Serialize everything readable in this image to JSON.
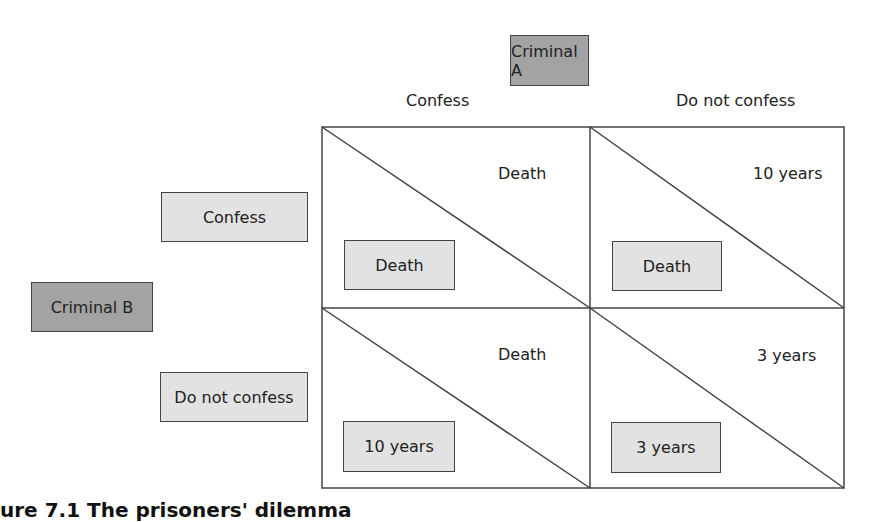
{
  "players": {
    "row_player": "Criminal B",
    "column_player": "Criminal A"
  },
  "column_strategies": [
    "Confess",
    "Do not confess"
  ],
  "row_strategies": [
    "Confess",
    "Do not confess"
  ],
  "cells": [
    {
      "row": "Confess",
      "col": "Confess",
      "payoff_A": "Death",
      "payoff_B": "Death"
    },
    {
      "row": "Confess",
      "col": "Do not confess",
      "payoff_A": "10 years",
      "payoff_B": "Death"
    },
    {
      "row": "Do not confess",
      "col": "Confess",
      "payoff_A": "Death",
      "payoff_B": "10 years"
    },
    {
      "row": "Do not confess",
      "col": "Do not confess",
      "payoff_A": "3 years",
      "payoff_B": "3 years"
    }
  ],
  "colors": {
    "player_box": "#a3a3a3",
    "strategy_box": "#e2e2e2",
    "lines": "#444444"
  },
  "caption": "ure 7.1 The prisoners' dilemma"
}
